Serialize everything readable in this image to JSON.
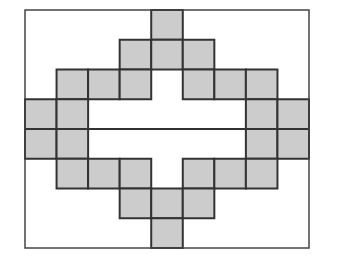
{
  "diagram": {
    "title": "",
    "frame": {
      "x": 25,
      "y": 10,
      "width": 284,
      "height": 238
    },
    "grid": {
      "cols": 9,
      "rows": 8
    },
    "colors": {
      "background": "#ffffff",
      "cell_fill": "#cccccc",
      "stroke": "#333333",
      "frame_stroke": "#444444"
    },
    "shaded_cells": [
      [
        0,
        4
      ],
      [
        1,
        3
      ],
      [
        1,
        4
      ],
      [
        1,
        5
      ],
      [
        2,
        1
      ],
      [
        2,
        2
      ],
      [
        2,
        3
      ],
      [
        2,
        5
      ],
      [
        2,
        6
      ],
      [
        2,
        7
      ],
      [
        3,
        0
      ],
      [
        3,
        1
      ],
      [
        3,
        7
      ],
      [
        3,
        8
      ],
      [
        4,
        0
      ],
      [
        4,
        1
      ],
      [
        4,
        7
      ],
      [
        4,
        8
      ],
      [
        5,
        1
      ],
      [
        5,
        2
      ],
      [
        5,
        3
      ],
      [
        5,
        5
      ],
      [
        5,
        6
      ],
      [
        5,
        7
      ],
      [
        6,
        3
      ],
      [
        6,
        4
      ],
      [
        6,
        5
      ],
      [
        7,
        4
      ]
    ],
    "lines": [
      {
        "name": "middle-divider-line",
        "x1": 25,
        "y1": 129,
        "x2": 309,
        "y2": 129
      }
    ]
  }
}
